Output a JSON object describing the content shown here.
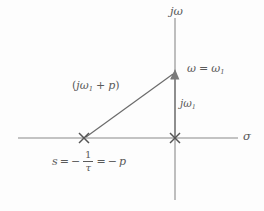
{
  "figure": {
    "background_color": "#fdfdfd",
    "line_color": "#6b6b6b",
    "text_color": "#5a5a5a"
  },
  "axes": {
    "vertical": {
      "label": "jω",
      "label_parts": {
        "j": "j",
        "omega": "ω"
      },
      "x": 175,
      "y_top": 18,
      "y_bottom": 200
    },
    "horizontal": {
      "label": "σ",
      "y": 138,
      "x_left": 18,
      "x_right": 238
    }
  },
  "markers": [
    {
      "name": "pole-marker",
      "glyph": "x",
      "x": 84,
      "y": 138,
      "label": "s = -1/τ = -p"
    },
    {
      "name": "origin-marker",
      "glyph": "x",
      "x": 175,
      "y": 138,
      "label": ""
    }
  ],
  "labels": {
    "jomega_axis": "jω",
    "sigma_axis": "σ",
    "omega_equals": {
      "omega": "ω",
      "equals": "=",
      "omega_sub": "ω",
      "subscript": "1",
      "full": "ω = ω1"
    },
    "vector": {
      "open": "(",
      "j": "j",
      "omega": "ω",
      "subscript": "1",
      "plus": "+",
      "p": "p",
      "close": ")",
      "full": "(jω1 + p)"
    },
    "jomega1": {
      "j": "j",
      "omega": "ω",
      "subscript": "1",
      "full": "jω1"
    },
    "pole": {
      "s": "s",
      "equals1": "=",
      "minus1": "−",
      "numerator": "1",
      "denominator": "τ",
      "equals2": "=",
      "minus2": "−",
      "p": "p",
      "full": "s = −1/τ = −p"
    }
  },
  "vectors": [
    {
      "name": "pole-to-point-vector",
      "from_x": 84,
      "from_y": 138,
      "to_x": 175,
      "to_y": 72,
      "label": "(jω1 + p)",
      "arrow": true
    },
    {
      "name": "imaginary-component-vector",
      "from_x": 175,
      "from_y": 138,
      "to_x": 175,
      "to_y": 72,
      "label": "jω1",
      "arrow": true
    }
  ]
}
